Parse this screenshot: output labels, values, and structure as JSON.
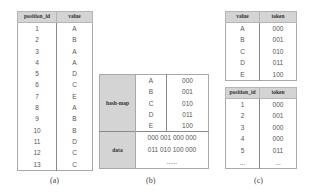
{
  "panel_a": {
    "caption": "(a)",
    "headers": [
      "position_id",
      "value"
    ],
    "rows": [
      [
        "1",
        "A"
      ],
      [
        "2",
        "B"
      ],
      [
        "3",
        "A"
      ],
      [
        "4",
        "A"
      ],
      [
        "5",
        "D"
      ],
      [
        "6",
        "C"
      ],
      [
        "7",
        "E"
      ],
      [
        "8",
        "A"
      ],
      [
        "9",
        "B"
      ],
      [
        "10",
        "B"
      ],
      [
        "11",
        "D"
      ],
      [
        "12",
        "C"
      ],
      [
        "13",
        "C"
      ]
    ]
  },
  "panel_b": {
    "caption": "(b)",
    "hash_map_label": "hash-map",
    "hash_map": [
      [
        "A",
        "000"
      ],
      [
        "B",
        "001"
      ],
      [
        "C",
        "010"
      ],
      [
        "D",
        "011"
      ],
      [
        "E",
        "100"
      ]
    ],
    "data_label": "data",
    "data_lines": [
      "000 001 000 000",
      "011 010 100 000",
      "......"
    ]
  },
  "panel_c": {
    "caption": "(c)",
    "token_table": {
      "headers": [
        "value",
        "token"
      ],
      "rows": [
        [
          "A",
          "000"
        ],
        [
          "B",
          "001"
        ],
        [
          "C",
          "010"
        ],
        [
          "D",
          "011"
        ],
        [
          "E",
          "100"
        ]
      ]
    },
    "position_table": {
      "headers": [
        "position_id",
        "token"
      ],
      "rows": [
        [
          "1",
          "000"
        ],
        [
          "2",
          "001"
        ],
        [
          "3",
          "000"
        ],
        [
          "4",
          "000"
        ],
        [
          "5",
          "011"
        ],
        [
          "...",
          "..."
        ]
      ]
    }
  },
  "colors": {
    "header_bg": "#d4d4d4",
    "border": "#a9a9a9",
    "text": "#555555"
  }
}
